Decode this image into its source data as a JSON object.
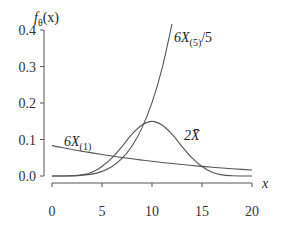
{
  "chart_data": {
    "type": "line",
    "title": "",
    "ylabel": "f_θ(x)",
    "xlabel": "x",
    "xlim": [
      0,
      20
    ],
    "ylim": [
      0,
      0.4
    ],
    "grid": false,
    "legend": "inline labels",
    "x_ticks": [
      "0",
      "5",
      "10",
      "15",
      "20"
    ],
    "y_ticks": [
      "0.0",
      "0.1",
      "0.2",
      "0.3",
      "0.4"
    ],
    "series": [
      {
        "name": "6X(1)",
        "x": [
          0,
          1,
          2,
          3,
          4,
          5,
          6,
          7,
          8,
          9,
          10,
          11,
          12,
          13,
          14,
          15,
          16,
          17,
          18,
          19,
          20
        ],
        "values": [
          0.0833,
          0.0779,
          0.0728,
          0.0679,
          0.0633,
          0.0589,
          0.0547,
          0.0508,
          0.0471,
          0.0436,
          0.0402,
          0.0371,
          0.0341,
          0.0313,
          0.0287,
          0.0264,
          0.0241,
          0.022,
          0.02,
          0.0182,
          0.0165
        ]
      },
      {
        "name": "6X(5)/5",
        "x": [
          0,
          2,
          4,
          5,
          6,
          7,
          8,
          9,
          10,
          11,
          12
        ],
        "values": [
          0,
          0.0003,
          0.0051,
          0.0126,
          0.026,
          0.0482,
          0.0823,
          0.1318,
          0.2009,
          0.2941,
          0.4167
        ]
      },
      {
        "name": "2X̄",
        "x": [
          0,
          1,
          2,
          3,
          4,
          5,
          6,
          7,
          8,
          9,
          10,
          11,
          12,
          13,
          14,
          15,
          16,
          17,
          18,
          19,
          20
        ],
        "values": [
          0,
          0.0001,
          0.0007,
          0.0031,
          0.0104,
          0.026,
          0.0495,
          0.0807,
          0.1146,
          0.1397,
          0.1497,
          0.1397,
          0.1146,
          0.0807,
          0.0495,
          0.026,
          0.0104,
          0.0031,
          0.0007,
          0.0001,
          0
        ]
      }
    ],
    "annotations": [
      {
        "text": "6X(1)",
        "series": "6X(1)"
      },
      {
        "text": "6X(5)/5",
        "series": "6X(5)/5"
      },
      {
        "text": "2X̄",
        "series": "2X̄"
      }
    ]
  },
  "labels": {
    "ylabel_main": "f",
    "ylabel_sub": "θ",
    "ylabel_arg": "(x)",
    "xlabel": "x",
    "s1_main": "6X",
    "s1_sub": "(1)",
    "s2_main": "6X",
    "s2_sub": "(5)",
    "s2_tail": "/5",
    "s3_main": "2X̄"
  }
}
